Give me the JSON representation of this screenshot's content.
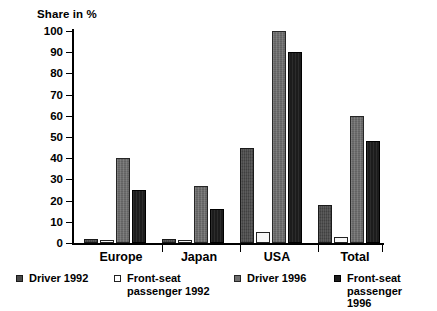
{
  "chart_data": {
    "type": "bar",
    "title": "",
    "ylabel": "Share in %",
    "xlabel": "",
    "ylim": [
      0,
      100
    ],
    "yticks": [
      0,
      10,
      20,
      30,
      40,
      50,
      60,
      70,
      80,
      90,
      100
    ],
    "grid": false,
    "legend_position": "bottom",
    "categories": [
      "Europe",
      "Japan",
      "USA",
      "Total"
    ],
    "series": [
      {
        "name": "Driver 1992",
        "color": "#4a4a4a",
        "values": [
          2,
          2,
          45,
          18
        ]
      },
      {
        "name": "Front-seat passenger 1992",
        "color": "#ffffff",
        "values": [
          1,
          1.5,
          5,
          3
        ]
      },
      {
        "name": "Driver 1996",
        "color": "#6e6e6e",
        "values": [
          40,
          27,
          100,
          60
        ]
      },
      {
        "name": "Front-seat passenger 1996",
        "color": "#1c1c1c",
        "values": [
          25,
          16,
          90,
          48
        ]
      }
    ]
  },
  "axis": {
    "title": "Share in %",
    "tick_labels": [
      "100",
      "90",
      "80",
      "70",
      "60",
      "50",
      "40",
      "30",
      "20",
      "10",
      "0"
    ]
  },
  "legend": {
    "items": [
      {
        "label": "Driver 1992"
      },
      {
        "label": "Front-seat\npassenger 1992"
      },
      {
        "label": "Driver 1996"
      },
      {
        "label": "Front-seat\npassenger 1996"
      }
    ]
  }
}
